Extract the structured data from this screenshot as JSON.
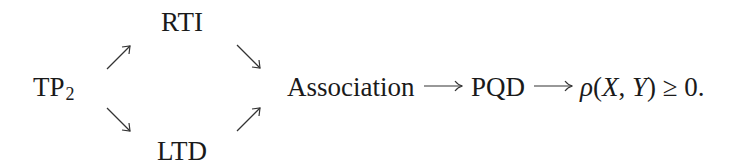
{
  "diagram": {
    "nodes": {
      "tp2": {
        "base": "TP",
        "subscript": "2"
      },
      "rti": {
        "label": "RTI"
      },
      "ltd": {
        "label": "LTD"
      },
      "association": {
        "label": "Association"
      },
      "pqd": {
        "label": "PQD"
      },
      "conclusion": {
        "rho": "ρ",
        "open_paren": "(",
        "x": "X",
        "comma": ", ",
        "y": "Y",
        "close_paren": ")",
        "relation": " ≥ 0."
      }
    },
    "edges": [
      {
        "from": "TP2",
        "to": "RTI",
        "direction": "north-east"
      },
      {
        "from": "TP2",
        "to": "LTD",
        "direction": "south-east"
      },
      {
        "from": "RTI",
        "to": "Association",
        "direction": "south-east"
      },
      {
        "from": "LTD",
        "to": "Association",
        "direction": "north-east"
      },
      {
        "from": "Association",
        "to": "PQD",
        "direction": "long-right"
      },
      {
        "from": "PQD",
        "to": "ρ(X,Y) ≥ 0",
        "direction": "long-right"
      }
    ],
    "colors": {
      "ink": "#1a1a1a",
      "arrow": "#333333",
      "background": "#ffffff"
    }
  }
}
